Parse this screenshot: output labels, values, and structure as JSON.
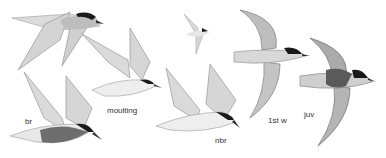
{
  "illustration": {
    "subject": "terns in flight, plumage stages",
    "colors": {
      "background": "#ffffff",
      "wing": "#d6d6d6",
      "wing_dark": "#8a8a8a",
      "body": "#eeeeee",
      "cap": "#1a1a1a",
      "belly_dark": "#6e6e6e",
      "label": "#333333"
    },
    "labels": {
      "br": "br",
      "moulting": "moulting",
      "nbr": "nbr",
      "first_winter": "1st w",
      "juv": "juv"
    }
  }
}
